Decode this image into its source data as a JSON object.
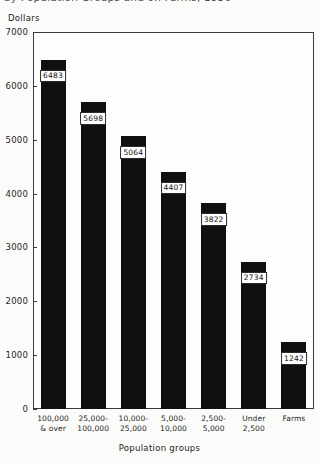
{
  "title": {
    "text": "by Population Groups and on Farms, 1950",
    "note": "cropped at top edge of screenshot"
  },
  "axis": {
    "y_caption": "Dollars",
    "x_caption": "Population groups"
  },
  "chart_data": {
    "type": "bar",
    "title": "by Population Groups and on Farms, 1950",
    "xlabel": "Population groups",
    "ylabel": "Dollars",
    "ylim": [
      0,
      7000
    ],
    "yticks": [
      0,
      1000,
      2000,
      3000,
      4000,
      5000,
      6000,
      7000
    ],
    "ytick_labels": [
      "0",
      "1000",
      "2000",
      "3000",
      "4000",
      "5000",
      "6000",
      "7000"
    ],
    "grid": false,
    "legend": "none",
    "bar_color": "#101010",
    "categories": [
      "100,000\n& over",
      "25,000-\n100,000",
      "10,000-\n25,000",
      "5,000-\n10,000",
      "2,500-\n5,000",
      "Under\n2,500",
      "Farms"
    ],
    "category_lines": [
      [
        "100,000",
        "& over"
      ],
      [
        "25,000-",
        "100,000"
      ],
      [
        "10,000-",
        "25,000"
      ],
      [
        "5,000-",
        "10,000"
      ],
      [
        "2,500-",
        "5,000"
      ],
      [
        "Under",
        "2,500"
      ],
      [
        "Farms",
        ""
      ]
    ],
    "values": [
      6483,
      5698,
      5064,
      4407,
      3822,
      2734,
      1242
    ],
    "value_labels": [
      "6483",
      "5698",
      "5064",
      "4407",
      "3822",
      "2734",
      "1242"
    ]
  }
}
